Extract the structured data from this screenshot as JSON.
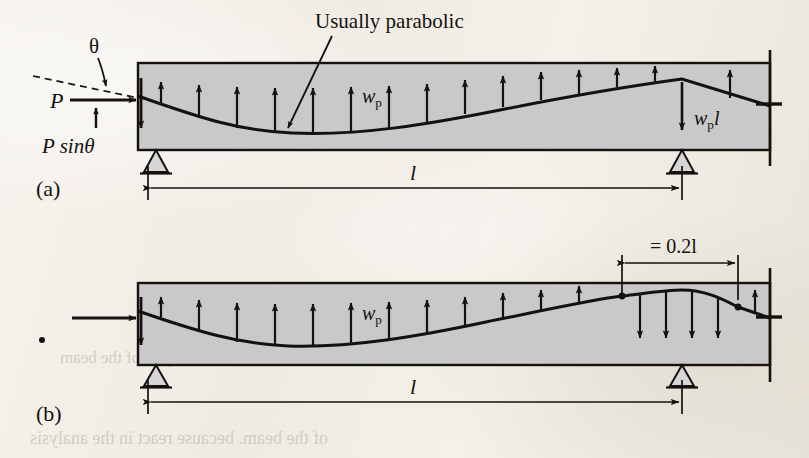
{
  "figure": {
    "type": "engineering-diagram",
    "panels": [
      {
        "id": "a",
        "panel_label": "(a)",
        "annotation": "Usually parabolic",
        "labels": {
          "theta": "θ",
          "force": "P",
          "vertical_component": "P sinθ",
          "distributed_load": "w",
          "distributed_load_sub": "p",
          "point_load": "w",
          "point_load_sub": "p",
          "point_load_tail": "l",
          "span": "l"
        },
        "upward_arrow_count": 13,
        "downward_arrow_count": 1,
        "tendon_shape": "parabolic-sag-then-rise-to-sharp-peak-over-support"
      },
      {
        "id": "b",
        "panel_label": "(b)",
        "labels": {
          "distributed_load": "w",
          "distributed_load_sub": "p",
          "cap_dimension": "= 0.2l",
          "span": "l"
        },
        "upward_arrow_count": 11,
        "downward_arrow_count": 4,
        "tendon_shape": "parabolic-sag-then-smooth-reverse-curve-cap-over-support"
      }
    ],
    "colors": {
      "beam_fill": "#c9c9c9",
      "ink": "#14110e",
      "paper": "#f2efe9",
      "support_fill": "#d6d6d6",
      "bleed_through": "#b9b2a5"
    },
    "bleed_through_text": [
      "Silhouette hand in the analysis of the beam",
      "of the beam. because react in the analysis"
    ]
  }
}
